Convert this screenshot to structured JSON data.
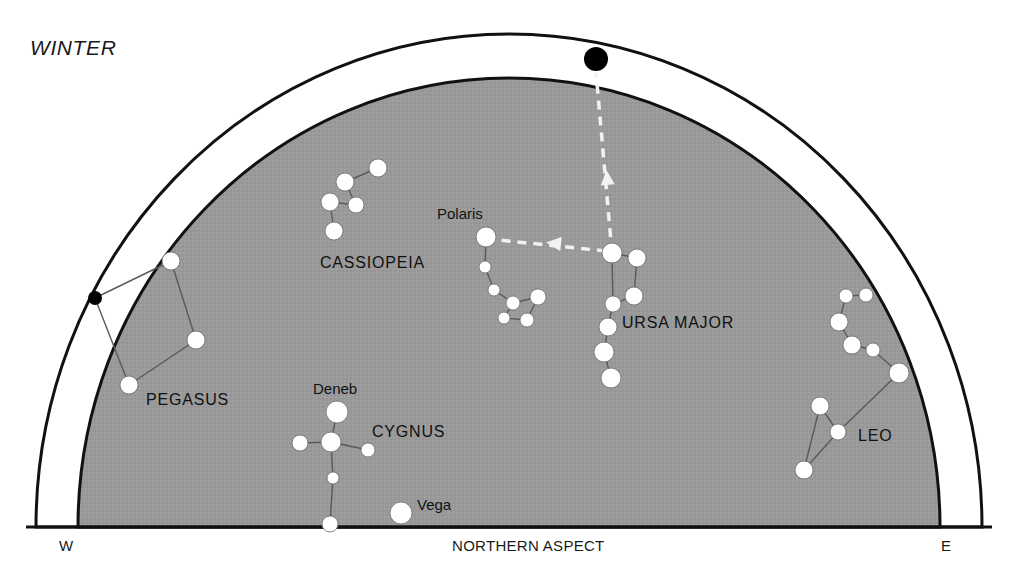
{
  "figure": {
    "season_title": "WINTER",
    "aspect_label": "NORTHERN ASPECT",
    "west_label": "W",
    "east_label": "E",
    "colors": {
      "sky_fill": "#9a9a9a",
      "outline": "#111111",
      "star_fill": "#ffffff",
      "star_stroke": "#6b6b6b",
      "zenith_marker": "#000000",
      "pointer": "#f2f2f2",
      "constellation_line": "#5a5a5a",
      "background": "#ffffff"
    }
  },
  "chart_data": {
    "type": "scatter",
    "title": "WINTER",
    "xlabel": "NORTHERN ASPECT",
    "ylabel": "",
    "grid": false,
    "legend": false,
    "projection": "horizon dome, northern aspect",
    "axis_endpoints": {
      "left": "W",
      "right": "E"
    },
    "horizon": {
      "baseline_y": 527,
      "left_x": 36,
      "right_x": 982
    },
    "dome": {
      "outer_arc": {
        "cx": 509,
        "cy": 527,
        "rx": 473,
        "ry": 493
      },
      "inner_arc": {
        "cx": 509,
        "cy": 527,
        "rx": 431,
        "ry": 449
      }
    },
    "markers": [
      {
        "name": "zenith",
        "x": 596,
        "y": 59,
        "r": 12,
        "fill": "#000000",
        "label": ""
      },
      {
        "name": "pegasus-outer-star",
        "x": 95,
        "y": 298,
        "r": 7,
        "fill": "#000000",
        "label": ""
      }
    ],
    "pointers": [
      {
        "name": "dipper-to-zenith",
        "from": {
          "x": 612,
          "y": 253
        },
        "to": {
          "x": 596,
          "y": 72
        },
        "style": "dashed",
        "arrowhead_at": {
          "x": 607,
          "y": 176
        }
      },
      {
        "name": "dipper-to-polaris",
        "from": {
          "x": 606,
          "y": 251
        },
        "to": {
          "x": 498,
          "y": 240
        },
        "style": "dashed",
        "arrowhead_at": {
          "x": 552,
          "y": 243
        }
      }
    ],
    "constellations": [
      {
        "name": "CASSIOPEIA",
        "label_x": 320,
        "label_y": 254,
        "stars": [
          {
            "x": 378,
            "y": 168,
            "r": 9
          },
          {
            "x": 345,
            "y": 182,
            "r": 9
          },
          {
            "x": 356,
            "y": 205,
            "r": 8
          },
          {
            "x": 330,
            "y": 202,
            "r": 9
          },
          {
            "x": 334,
            "y": 231,
            "r": 9
          }
        ],
        "lines": [
          [
            0,
            1
          ],
          [
            1,
            2
          ],
          [
            2,
            3
          ],
          [
            3,
            4
          ]
        ]
      },
      {
        "name": "URSA MINOR",
        "label_x": null,
        "label_y": null,
        "hidden_label": true,
        "stars": [
          {
            "x": 486,
            "y": 237,
            "r": 10,
            "star_name": "Polaris",
            "label_x": 437,
            "label_y": 205
          },
          {
            "x": 485,
            "y": 267,
            "r": 6
          },
          {
            "x": 494,
            "y": 290,
            "r": 6
          },
          {
            "x": 513,
            "y": 303,
            "r": 7
          },
          {
            "x": 538,
            "y": 297,
            "r": 8
          },
          {
            "x": 527,
            "y": 320,
            "r": 7
          },
          {
            "x": 504,
            "y": 318,
            "r": 6
          }
        ],
        "lines": [
          [
            0,
            1
          ],
          [
            1,
            2
          ],
          [
            2,
            3
          ],
          [
            3,
            4
          ],
          [
            4,
            5
          ],
          [
            5,
            6
          ],
          [
            6,
            3
          ]
        ]
      },
      {
        "name": "URSA MAJOR",
        "label_x": 622,
        "label_y": 314,
        "stars": [
          {
            "x": 612,
            "y": 253,
            "r": 10
          },
          {
            "x": 637,
            "y": 258,
            "r": 9
          },
          {
            "x": 634,
            "y": 296,
            "r": 9
          },
          {
            "x": 613,
            "y": 304,
            "r": 8
          },
          {
            "x": 608,
            "y": 327,
            "r": 9
          },
          {
            "x": 604,
            "y": 352,
            "r": 10
          },
          {
            "x": 611,
            "y": 378,
            "r": 10
          }
        ],
        "lines": [
          [
            0,
            1
          ],
          [
            1,
            2
          ],
          [
            2,
            3
          ],
          [
            3,
            0
          ],
          [
            3,
            4
          ],
          [
            4,
            5
          ],
          [
            5,
            6
          ]
        ]
      },
      {
        "name": "PEGASUS",
        "label_x": 146,
        "label_y": 391,
        "stars": [
          {
            "x": 171,
            "y": 261,
            "r": 9
          },
          {
            "x": 196,
            "y": 340,
            "r": 9
          },
          {
            "x": 129,
            "y": 385,
            "r": 9
          }
        ],
        "lines": [
          [
            0,
            1
          ],
          [
            1,
            2
          ]
        ],
        "outer_links": [
          {
            "from_marker": "pegasus-outer-star",
            "to_star": 0
          },
          {
            "from_marker": "pegasus-outer-star",
            "to_star": 2
          }
        ]
      },
      {
        "name": "CYGNUS",
        "label_x": 372,
        "label_y": 423,
        "stars": [
          {
            "x": 337,
            "y": 412,
            "r": 11,
            "star_name": "Deneb",
            "label_x": 313,
            "label_y": 380
          },
          {
            "x": 331,
            "y": 442,
            "r": 10
          },
          {
            "x": 300,
            "y": 443,
            "r": 8
          },
          {
            "x": 368,
            "y": 450,
            "r": 7
          },
          {
            "x": 333,
            "y": 478,
            "r": 6
          },
          {
            "x": 330,
            "y": 524,
            "r": 8
          }
        ],
        "lines": [
          [
            0,
            1
          ],
          [
            1,
            2
          ],
          [
            1,
            3
          ],
          [
            1,
            4
          ],
          [
            4,
            5
          ]
        ]
      },
      {
        "name": "LEO",
        "label_x": 858,
        "label_y": 427,
        "stars": [
          {
            "x": 866,
            "y": 295,
            "r": 7
          },
          {
            "x": 846,
            "y": 296,
            "r": 7
          },
          {
            "x": 839,
            "y": 322,
            "r": 9
          },
          {
            "x": 852,
            "y": 345,
            "r": 9
          },
          {
            "x": 873,
            "y": 350,
            "r": 7
          },
          {
            "x": 899,
            "y": 373,
            "r": 10
          },
          {
            "x": 838,
            "y": 432,
            "r": 8
          },
          {
            "x": 820,
            "y": 406,
            "r": 9
          },
          {
            "x": 804,
            "y": 470,
            "r": 9
          }
        ],
        "lines": [
          [
            0,
            1
          ],
          [
            1,
            2
          ],
          [
            2,
            3
          ],
          [
            3,
            4
          ],
          [
            4,
            5
          ],
          [
            5,
            6
          ],
          [
            6,
            7
          ],
          [
            7,
            8
          ],
          [
            8,
            6
          ]
        ]
      }
    ],
    "isolated_stars": [
      {
        "star_name": "Vega",
        "x": 401,
        "y": 513,
        "r": 11,
        "label_x": 417,
        "label_y": 496
      }
    ]
  }
}
